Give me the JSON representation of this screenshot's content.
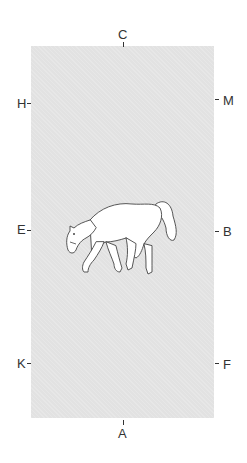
{
  "arena": {
    "fill_color": "#e2e2e2",
    "letters": {
      "top": "C",
      "bottom": "A",
      "left_upper": "H",
      "left_middle": "E",
      "left_lower": "K",
      "right_upper": "M",
      "right_middle": "B",
      "right_lower": "F"
    },
    "figure": "horse-walking-icon"
  }
}
